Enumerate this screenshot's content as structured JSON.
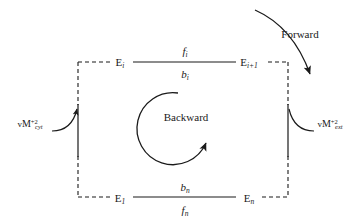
{
  "figure": {
    "type": "kinetic-cycle-diagram",
    "title": "",
    "background_color": "#ffffff",
    "stroke_color": "#1a1a1a",
    "width": 356,
    "height": 222
  },
  "states": {
    "top_left": {
      "symbol": "E",
      "subscript": "i",
      "x": 120,
      "y": 62
    },
    "top_right": {
      "symbol": "E",
      "subscript": "i+1",
      "x": 249,
      "y": 62
    },
    "bottom_left": {
      "symbol": "E",
      "subscript": "1",
      "x": 120,
      "y": 198
    },
    "bottom_right": {
      "symbol": "E",
      "subscript": "n",
      "x": 249,
      "y": 198
    }
  },
  "rates": {
    "top_above": {
      "symbol": "f",
      "subscript": "i",
      "x": 185,
      "y": 51
    },
    "top_below": {
      "symbol": "b",
      "subscript": "i",
      "x": 185,
      "y": 74
    },
    "bottom_above": {
      "symbol": "b",
      "subscript": "n",
      "x": 185,
      "y": 187
    },
    "bottom_below": {
      "symbol": "f",
      "subscript": "n",
      "x": 185,
      "y": 210
    }
  },
  "species": {
    "left": {
      "prefix": "v",
      "element": "M",
      "charge": "+2",
      "compartment": "cyt",
      "x": 38,
      "y": 124
    },
    "right": {
      "prefix": "v",
      "element": "M",
      "charge": "+2",
      "compartment": "ext",
      "x": 320,
      "y": 124
    }
  },
  "annotations": {
    "forward": {
      "label": "Forward",
      "x": 300,
      "y": 34
    },
    "backward": {
      "label": "Backward",
      "x": 186,
      "y": 117
    }
  },
  "geometry": {
    "box": {
      "left": 78,
      "right": 288,
      "top": 62,
      "bottom": 197
    },
    "dash_pattern": "4,3",
    "solid_segment_left": {
      "x": 78,
      "y1": 104,
      "y2": 156
    },
    "solid_segment_right": {
      "x": 288,
      "y1": 104,
      "y2": 156
    },
    "top_solid_span": {
      "x1": 133,
      "x2": 236,
      "y": 62
    },
    "bottom_solid_span": {
      "x1": 133,
      "x2": 236,
      "y": 197
    }
  }
}
